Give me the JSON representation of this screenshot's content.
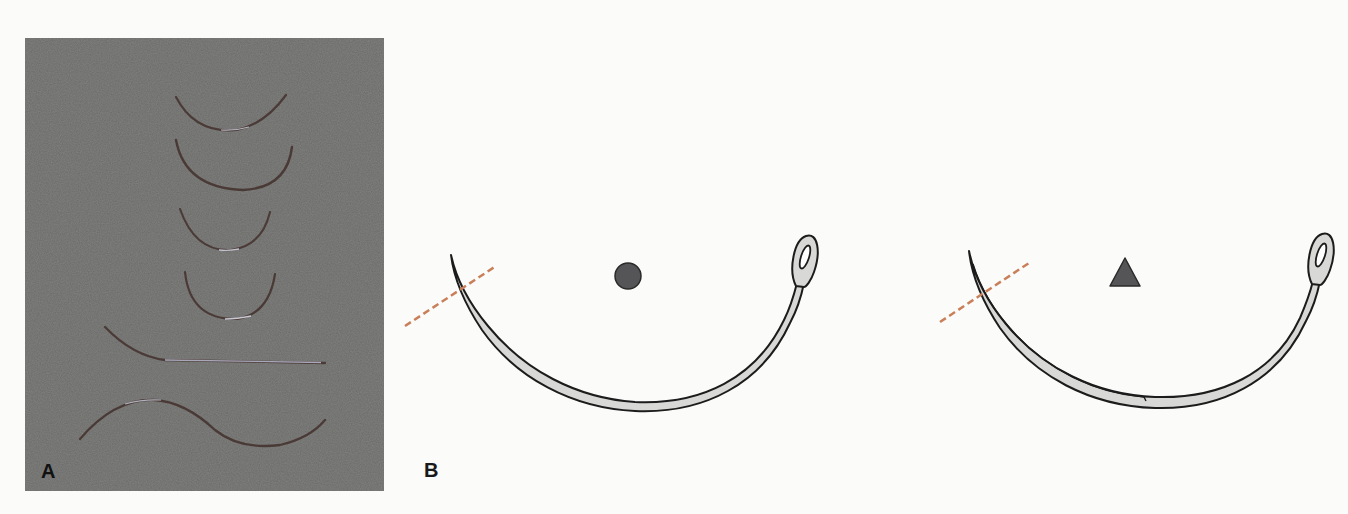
{
  "figure": {
    "panels": [
      {
        "id": "A",
        "label": "A",
        "type": "photograph",
        "background_color": "#6a6a69",
        "needles": [
          {
            "shape": "half-curved",
            "size": "medium"
          },
          {
            "shape": "half-curved",
            "size": "large"
          },
          {
            "shape": "half-curved",
            "size": "small"
          },
          {
            "shape": "half-curved",
            "size": "small"
          },
          {
            "shape": "straight-with-curved-end",
            "size": "long"
          },
          {
            "shape": "compound-curved-s",
            "size": "long"
          }
        ]
      },
      {
        "id": "B",
        "label": "B",
        "type": "illustration",
        "needles": [
          {
            "name": "round-bodied eyed curved needle",
            "cross_section_symbol": "circle",
            "symbol_color": "#555558",
            "has_cutting_edge": false
          },
          {
            "name": "cutting eyed curved needle",
            "cross_section_symbol": "triangle",
            "symbol_color": "#555558",
            "has_cutting_edge": true
          }
        ],
        "cross_section_line_color": "#c9805a",
        "needle_fill_color": "#d8d8d6",
        "needle_outline_color": "#1c1c1c"
      }
    ]
  }
}
